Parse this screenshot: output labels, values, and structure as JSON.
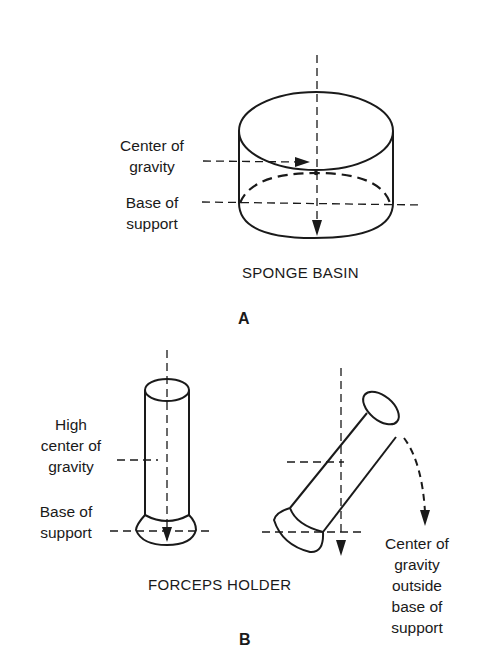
{
  "panel_a": {
    "letter": "A",
    "caption": "SPONGE BASIN",
    "labels": {
      "center_of_gravity": [
        "Center of",
        "gravity"
      ],
      "base_of_support": [
        "Base of",
        "support"
      ]
    }
  },
  "panel_b": {
    "letter": "B",
    "caption": "FORCEPS HOLDER",
    "labels": {
      "high_center_of_gravity": [
        "High",
        "center of",
        "gravity"
      ],
      "base_of_support": [
        "Base of",
        "support"
      ],
      "cg_outside": [
        "Center of",
        "gravity",
        "outside",
        "base of",
        "support"
      ]
    }
  },
  "colors": {
    "ink": "#1a1a1a",
    "background": "#ffffff"
  }
}
